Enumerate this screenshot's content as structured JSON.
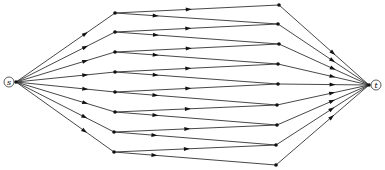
{
  "diagram": {
    "type": "directed-graph",
    "source": {
      "label": "s",
      "x": 10,
      "y": 82
    },
    "sink": {
      "label": "t",
      "x": 375,
      "y": 85
    },
    "colors": {
      "edge": "#333333",
      "node": "#111111",
      "background": "#ffffff"
    },
    "left_nodes": [
      {
        "x": 115,
        "y": 13
      },
      {
        "x": 115,
        "y": 32
      },
      {
        "x": 115,
        "y": 52
      },
      {
        "x": 115,
        "y": 72
      },
      {
        "x": 115,
        "y": 92
      },
      {
        "x": 115,
        "y": 112
      },
      {
        "x": 114,
        "y": 132
      },
      {
        "x": 114,
        "y": 152
      }
    ],
    "right_nodes": [
      {
        "x": 279,
        "y": 5
      },
      {
        "x": 278,
        "y": 24
      },
      {
        "x": 279,
        "y": 44
      },
      {
        "x": 278,
        "y": 64
      },
      {
        "x": 278,
        "y": 84
      },
      {
        "x": 277,
        "y": 105
      },
      {
        "x": 277,
        "y": 125
      },
      {
        "x": 276,
        "y": 145
      },
      {
        "x": 276,
        "y": 165
      }
    ]
  }
}
